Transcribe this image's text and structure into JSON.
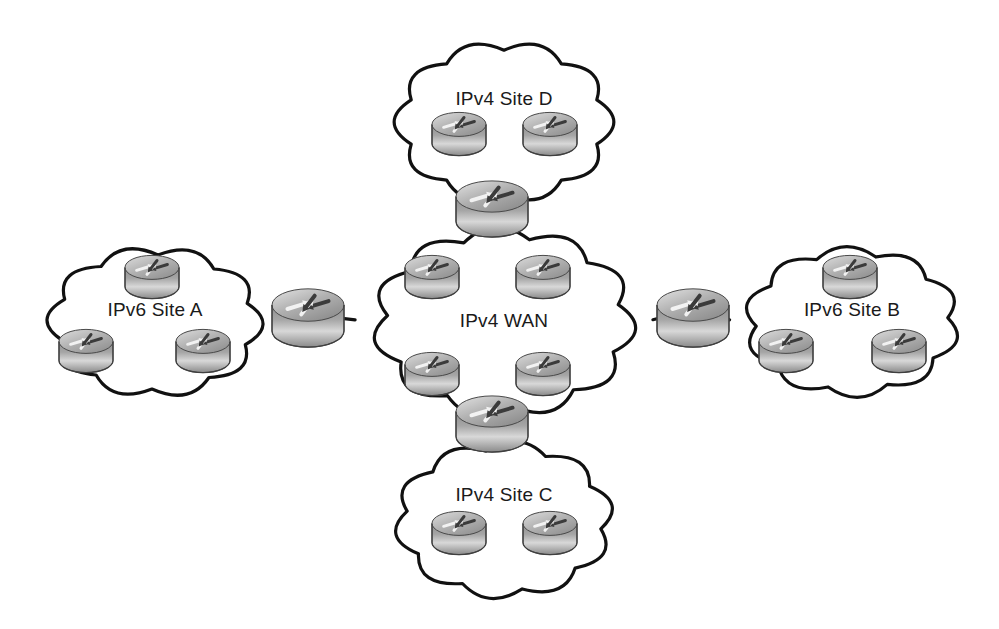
{
  "diagram": {
    "background_color": "#ffffff",
    "outline_color": "#111111",
    "label_color": "#1a1a1a",
    "router_body_color": "#8f8f8f",
    "router_top_color": "#cfcfcf",
    "clouds": [
      {
        "id": "site-d",
        "label": "IPv4 Site D",
        "cx": 504,
        "cy": 122,
        "rx": 122,
        "ry": 92,
        "label_dy": -22,
        "routers": [
          {
            "id": "site-d-router-1",
            "cx": 459,
            "cy": 134,
            "w": 54,
            "h": 40
          },
          {
            "id": "site-d-router-2",
            "cx": 550,
            "cy": 134,
            "w": 54,
            "h": 40
          }
        ]
      },
      {
        "id": "ipv4-wan",
        "label": "IPv4 WAN",
        "cx": 504,
        "cy": 322,
        "rx": 146,
        "ry": 108,
        "label_dy": 0,
        "routers": [
          {
            "id": "wan-router-1",
            "cx": 432,
            "cy": 277,
            "w": 54,
            "h": 40
          },
          {
            "id": "wan-router-2",
            "cx": 543,
            "cy": 277,
            "w": 54,
            "h": 40
          },
          {
            "id": "wan-router-3",
            "cx": 432,
            "cy": 374,
            "w": 54,
            "h": 40
          },
          {
            "id": "wan-router-4",
            "cx": 543,
            "cy": 374,
            "w": 54,
            "h": 40
          }
        ]
      },
      {
        "id": "site-c",
        "label": "IPv4 Site C",
        "cx": 504,
        "cy": 520,
        "rx": 122,
        "ry": 90,
        "label_dy": -24,
        "routers": [
          {
            "id": "site-c-router-1",
            "cx": 459,
            "cy": 533,
            "w": 54,
            "h": 40
          },
          {
            "id": "site-c-router-2",
            "cx": 550,
            "cy": 533,
            "w": 54,
            "h": 40
          }
        ]
      },
      {
        "id": "site-a",
        "label": "IPv6 Site A",
        "cx": 155,
        "cy": 322,
        "rx": 120,
        "ry": 86,
        "label_dy": -11,
        "routers": [
          {
            "id": "site-a-router-1",
            "cx": 152,
            "cy": 277,
            "w": 54,
            "h": 40
          },
          {
            "id": "site-a-router-2",
            "cx": 86,
            "cy": 351,
            "w": 54,
            "h": 40
          },
          {
            "id": "site-a-router-3",
            "cx": 203,
            "cy": 351,
            "w": 54,
            "h": 40
          }
        ]
      },
      {
        "id": "site-b",
        "label": "IPv6 Site B",
        "cx": 852,
        "cy": 322,
        "rx": 120,
        "ry": 86,
        "label_dy": -11,
        "routers": [
          {
            "id": "site-b-router-1",
            "cx": 850,
            "cy": 277,
            "w": 54,
            "h": 40
          },
          {
            "id": "site-b-router-2",
            "cx": 786,
            "cy": 351,
            "w": 54,
            "h": 40
          },
          {
            "id": "site-b-router-3",
            "cx": 899,
            "cy": 351,
            "w": 54,
            "h": 40
          }
        ]
      }
    ],
    "edge_routers": [
      {
        "id": "edge-router-north",
        "name": "north-edge-router",
        "cx": 492,
        "cy": 209,
        "w": 72,
        "h": 52
      },
      {
        "id": "edge-router-south",
        "name": "south-edge-router",
        "cx": 492,
        "cy": 424,
        "w": 72,
        "h": 52
      },
      {
        "id": "edge-router-west",
        "name": "west-edge-router",
        "cx": 308,
        "cy": 318,
        "w": 72,
        "h": 54
      },
      {
        "id": "edge-router-east",
        "name": "east-edge-router",
        "cx": 693,
        "cy": 318,
        "w": 72,
        "h": 54
      }
    ],
    "links": [
      {
        "id": "link-site-d-to-north-edge",
        "from": "site-d",
        "to": "edge-router-north"
      },
      {
        "id": "link-north-edge-to-wan",
        "from": "edge-router-north",
        "to": "ipv4-wan"
      },
      {
        "id": "link-wan-to-south-edge",
        "from": "ipv4-wan",
        "to": "edge-router-south"
      },
      {
        "id": "link-south-edge-to-site-c",
        "from": "edge-router-south",
        "to": "site-c"
      },
      {
        "id": "link-site-a-to-west-edge",
        "from": "site-a",
        "to": "edge-router-west"
      },
      {
        "id": "link-west-edge-to-wan",
        "from": "edge-router-west",
        "to": "ipv4-wan"
      },
      {
        "id": "link-wan-to-east-edge",
        "from": "ipv4-wan",
        "to": "edge-router-east"
      },
      {
        "id": "link-east-edge-to-site-b",
        "from": "edge-router-east",
        "to": "site-b"
      }
    ]
  }
}
